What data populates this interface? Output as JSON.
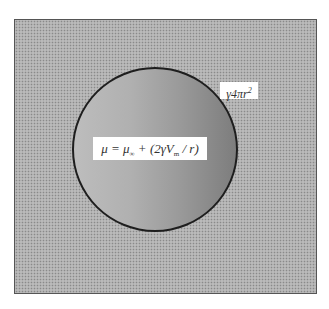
{
  "diagram": {
    "particle_equation": {
      "lhs": "μ",
      "eq": " = ",
      "mu": "μ",
      "mu_sub": "∞",
      "middle": " + (2γV",
      "v_sub": "m",
      "tail": " / r)"
    },
    "surface_energy": {
      "base": "γ4πr",
      "exponent": "2"
    },
    "colors": {
      "matrix_dots": "#8a8a8a",
      "particle_light": "#bdbdbd",
      "particle_dark": "#7d7d7d",
      "particle_outline": "#1e1e1e"
    }
  }
}
